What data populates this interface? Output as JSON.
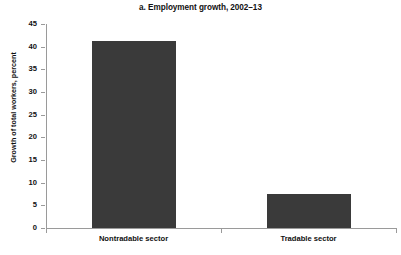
{
  "chart_data": {
    "type": "bar",
    "title": "a. Employment growth, 2002–13",
    "xlabel": "",
    "ylabel": "Growth of total workers, percent",
    "categories": [
      "Nontradable sector",
      "Tradable sector"
    ],
    "values": [
      41.2,
      7.5
    ],
    "ylim": [
      0,
      45
    ],
    "yticks": [
      0,
      5,
      10,
      15,
      20,
      25,
      30,
      35,
      40,
      45
    ],
    "ytick_labels": [
      "0",
      "5",
      "10",
      "15",
      "20",
      "25",
      "30",
      "35",
      "40",
      "45"
    ],
    "grid": false,
    "legend": null,
    "bar_color": "#3a3a3a",
    "axis_color": "#9a9a9a",
    "text_color": "#111111"
  }
}
